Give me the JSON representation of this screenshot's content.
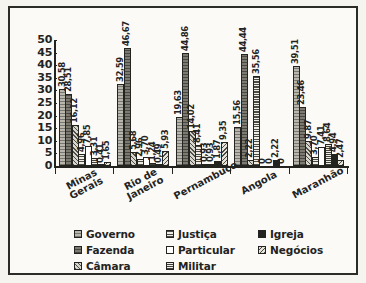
{
  "chart_data": {
    "type": "bar",
    "title": "",
    "xlabel": "",
    "ylabel": "",
    "ylim": [
      0,
      50
    ],
    "yticks": [
      50,
      45,
      40,
      35,
      30,
      25,
      20,
      15,
      10,
      5,
      0
    ],
    "grid": false,
    "legend_position": "bottom",
    "categories": [
      "Minas Gerais",
      "Rio de Janeiro",
      "Pernambuco",
      "Angola",
      "Maranhão"
    ],
    "category_lines": [
      [
        "Minas",
        "Gerais"
      ],
      [
        "Rio de",
        "Janeiro"
      ],
      [
        "Pernambuco"
      ],
      [
        "Angola"
      ],
      [
        "Maranhão"
      ]
    ],
    "series": [
      {
        "name": "Governo",
        "pattern": "p-governo",
        "values": [
          30.58,
          32.59,
          19.63,
          15.56,
          39.51
        ],
        "labels": [
          "30,58",
          "32,59",
          "19,63",
          "15,56",
          "39,51"
        ]
      },
      {
        "name": "Fazenda",
        "pattern": "p-fazenda",
        "values": [
          28.51,
          46.67,
          44.86,
          44.44,
          23.46
        ],
        "labels": [
          "28,51",
          "46,67",
          "44,86",
          "44,44",
          "23,46"
        ]
      },
      {
        "name": "Câmara",
        "pattern": "p-camara",
        "values": [
          16.12,
          5.68,
          14.02,
          2.22,
          9.87
        ],
        "labels": [
          "16,12",
          "5,68",
          "14,02",
          "2,22",
          "9,87"
        ]
      },
      {
        "name": "Justiça",
        "pattern": "p-justica",
        "values": [
          4.96,
          2.96,
          8.41,
          35.56,
          3.7
        ],
        "labels": [
          "4,96",
          "2,96",
          "8,41",
          "35,56",
          "3,70"
        ]
      },
      {
        "name": "Particular",
        "pattern": "p-particular",
        "values": [
          7.85,
          3.7,
          0.93,
          0.0,
          7.41
        ],
        "labels": [
          "7,85",
          "3,70",
          "0,93",
          "0",
          "7,41"
        ]
      },
      {
        "name": "Militar",
        "pattern": "p-militar",
        "values": [
          3.31,
          1.24,
          0.93,
          0.0,
          8.64
        ],
        "labels": [
          "3,31",
          "1,24",
          "0,93",
          "0",
          "8,64"
        ]
      },
      {
        "name": "Igreja",
        "pattern": "p-igreja",
        "values": [
          0.41,
          0.49,
          1.87,
          2.22,
          4.94
        ],
        "labels": [
          "0,41",
          "0,49",
          "1,87",
          "2,22",
          "4,94"
        ]
      },
      {
        "name": "Negócios",
        "pattern": "p-negocios",
        "values": [
          1.65,
          5.93,
          9.35,
          0.0,
          2.47
        ],
        "labels": [
          "1,65",
          "5,93",
          "9,35",
          "0",
          "2,47"
        ]
      }
    ]
  },
  "legend": {
    "items": [
      {
        "label": "Governo",
        "pattern": "p-governo"
      },
      {
        "label": "Justiça",
        "pattern": "p-justica"
      },
      {
        "label": "Igreja",
        "pattern": "p-igreja"
      },
      {
        "label": "Fazenda",
        "pattern": "p-fazenda"
      },
      {
        "label": "Particular",
        "pattern": "p-particular"
      },
      {
        "label": "Negócios",
        "pattern": "p-negocios"
      },
      {
        "label": "Câmara",
        "pattern": "p-camara"
      },
      {
        "label": "Militar",
        "pattern": "p-militar"
      }
    ]
  }
}
